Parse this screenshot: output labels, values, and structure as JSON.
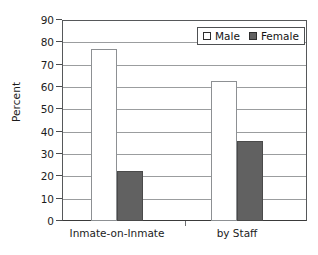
{
  "chart_data": {
    "type": "bar",
    "title": "",
    "xlabel": "",
    "ylabel": "Percent",
    "categories": [
      "Inmate-on-Inmate",
      "by Staff"
    ],
    "series": [
      {
        "name": "Male",
        "values": [
          77,
          62.5
        ],
        "color": "#ffffff"
      },
      {
        "name": "Female",
        "values": [
          22.5,
          36
        ],
        "color": "#616161"
      }
    ],
    "ylim": [
      0,
      90
    ],
    "ytick_step": 10,
    "yticks": [
      "90",
      "80",
      "70",
      "60",
      "50",
      "40",
      "30",
      "20",
      "10",
      "0"
    ],
    "grid": "horizontal",
    "legend_position": "top-right"
  },
  "legend": {
    "items": [
      {
        "label": "Male",
        "swatch": "open-square-swatch"
      },
      {
        "label": "Female",
        "swatch": "filled-square-swatch"
      }
    ]
  },
  "colors": {
    "male_fill": "#ffffff",
    "female_fill": "#616161",
    "axis": "#56585a",
    "gridline": "#9b9d9f",
    "text": "#1c1c1c"
  }
}
